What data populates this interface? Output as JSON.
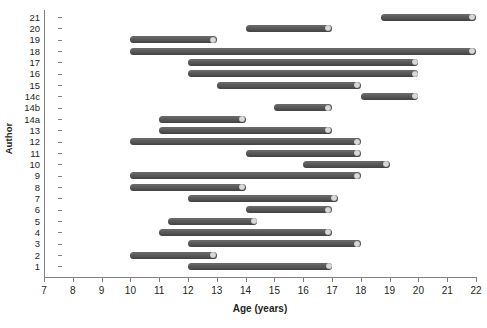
{
  "chart_data": {
    "type": "bar",
    "orientation": "horizontal-range",
    "title": "",
    "xlabel": "Age (years)",
    "ylabel": "Author",
    "xlim": [
      7,
      22
    ],
    "ylim_categories": [
      "1",
      "2",
      "3",
      "4",
      "5",
      "6",
      "7",
      "8",
      "9",
      "10",
      "11",
      "12",
      "13",
      "14a",
      "14b",
      "14c",
      "15",
      "16",
      "17",
      "18",
      "19",
      "20",
      "21"
    ],
    "xticks": [
      7,
      8,
      9,
      10,
      11,
      12,
      13,
      14,
      15,
      16,
      17,
      18,
      19,
      20,
      21,
      22
    ],
    "xtick_labels": [
      "7",
      "8",
      "9",
      "10",
      "11",
      "12",
      "13",
      "14",
      "15",
      "16",
      "17",
      "18",
      "19",
      "20",
      "21",
      "22"
    ],
    "grid": false,
    "legend": false,
    "bar_color": "#595959",
    "cap_color": "#d9d9d9",
    "categories": [
      "21",
      "20",
      "19",
      "18",
      "17",
      "16",
      "15",
      "14c",
      "14b",
      "14a",
      "13",
      "12",
      "11",
      "10",
      "9",
      "8",
      "7",
      "6",
      "5",
      "4",
      "3",
      "2",
      "1"
    ],
    "ranges": [
      {
        "category": "21",
        "start": 18.7,
        "end": 22.0
      },
      {
        "category": "20",
        "start": 14.0,
        "end": 17.0
      },
      {
        "category": "19",
        "start": 10.0,
        "end": 13.0
      },
      {
        "category": "18",
        "start": 10.0,
        "end": 22.0
      },
      {
        "category": "17",
        "start": 12.0,
        "end": 20.0
      },
      {
        "category": "16",
        "start": 12.0,
        "end": 20.0
      },
      {
        "category": "15",
        "start": 13.0,
        "end": 18.0
      },
      {
        "category": "14c",
        "start": 18.0,
        "end": 20.0
      },
      {
        "category": "14b",
        "start": 15.0,
        "end": 17.0
      },
      {
        "category": "14a",
        "start": 11.0,
        "end": 14.0
      },
      {
        "category": "13",
        "start": 11.0,
        "end": 17.0
      },
      {
        "category": "12",
        "start": 10.0,
        "end": 18.0
      },
      {
        "category": "11",
        "start": 14.0,
        "end": 18.0
      },
      {
        "category": "10",
        "start": 16.0,
        "end": 19.0
      },
      {
        "category": "9",
        "start": 10.0,
        "end": 18.0
      },
      {
        "category": "8",
        "start": 10.0,
        "end": 14.0
      },
      {
        "category": "7",
        "start": 12.0,
        "end": 17.2
      },
      {
        "category": "6",
        "start": 14.0,
        "end": 17.0
      },
      {
        "category": "5",
        "start": 11.3,
        "end": 14.4
      },
      {
        "category": "4",
        "start": 11.0,
        "end": 17.0
      },
      {
        "category": "3",
        "start": 12.0,
        "end": 18.0
      },
      {
        "category": "2",
        "start": 10.0,
        "end": 13.0
      },
      {
        "category": "1",
        "start": 12.0,
        "end": 17.0
      }
    ]
  }
}
